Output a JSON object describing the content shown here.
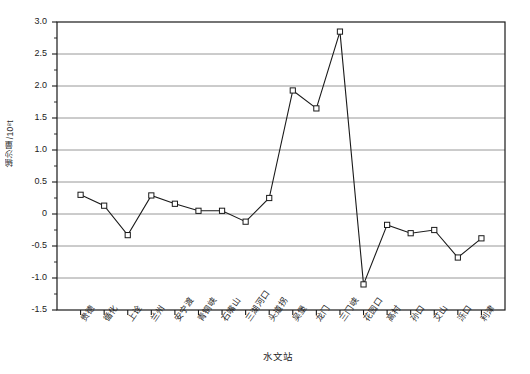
{
  "chart_data": {
    "type": "line",
    "title": "",
    "xlabel": "水文站",
    "ylabel": "输沙量/10⁸t",
    "ylim": [
      -1.5,
      3.0
    ],
    "ytick_labels": [
      "3.0",
      "2.5",
      "2.0",
      "1.5",
      "1.0",
      "0.5",
      "0",
      "-0.5",
      "-1.0",
      "-1.5"
    ],
    "ytick_values": [
      3.0,
      2.5,
      2.0,
      1.5,
      1.0,
      0.5,
      0,
      -0.5,
      -1.0,
      -1.5
    ],
    "grid": true,
    "minor_ticks": true,
    "legend": "none",
    "marker": "open-square",
    "line_color": "#1a1a1a",
    "grid_color": "#8c8c8c",
    "categories": [
      "贵德",
      "循化",
      "上诠",
      "兰州",
      "安宁渡",
      "青铜峡",
      "石嘴山",
      "三湖河口",
      "头道拐",
      "吴堡",
      "龙门",
      "三门峡",
      "花园口",
      "高村",
      "孙口",
      "艾山",
      "泺口",
      "利津"
    ],
    "values": [
      0.3,
      0.13,
      -0.33,
      0.29,
      0.16,
      0.05,
      0.05,
      -0.12,
      0.25,
      1.93,
      1.65,
      2.85,
      -1.1,
      -0.17,
      -0.3,
      -0.25,
      -0.68,
      -0.38
    ]
  }
}
